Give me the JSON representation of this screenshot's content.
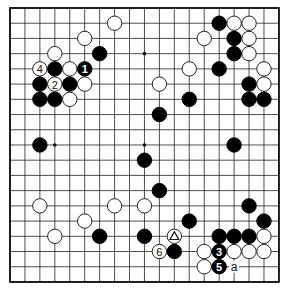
{
  "board": {
    "size": 19,
    "origin": {
      "x": 10,
      "y": 8
    },
    "spacing": {
      "x": 14.94,
      "y": 15.22
    },
    "stone_radius": 7.2,
    "colors": {
      "black": "#000000",
      "white": "#ffffff",
      "lines": "#222222",
      "background": "#ffffff"
    },
    "star_points": [
      [
        3,
        3
      ],
      [
        9,
        3
      ],
      [
        15,
        3
      ],
      [
        3,
        9
      ],
      [
        9,
        9
      ],
      [
        15,
        9
      ],
      [
        3,
        15
      ],
      [
        9,
        15
      ],
      [
        15,
        15
      ]
    ]
  },
  "stones": [
    {
      "c": 7,
      "r": 1,
      "color": "white"
    },
    {
      "c": 14,
      "r": 1,
      "color": "black"
    },
    {
      "c": 15,
      "r": 1,
      "color": "white"
    },
    {
      "c": 16,
      "r": 1,
      "color": "white"
    },
    {
      "c": 5,
      "r": 2,
      "color": "white"
    },
    {
      "c": 13,
      "r": 2,
      "color": "white"
    },
    {
      "c": 15,
      "r": 2,
      "color": "black"
    },
    {
      "c": 16,
      "r": 2,
      "color": "white"
    },
    {
      "c": 3,
      "r": 3,
      "color": "white"
    },
    {
      "c": 6,
      "r": 3,
      "color": "black"
    },
    {
      "c": 15,
      "r": 3,
      "color": "black"
    },
    {
      "c": 16,
      "r": 3,
      "color": "white"
    },
    {
      "c": 2,
      "r": 4,
      "color": "white",
      "label": "4"
    },
    {
      "c": 3,
      "r": 4,
      "color": "black"
    },
    {
      "c": 4,
      "r": 4,
      "color": "white"
    },
    {
      "c": 5,
      "r": 4,
      "color": "black",
      "label": "1"
    },
    {
      "c": 12,
      "r": 4,
      "color": "white"
    },
    {
      "c": 14,
      "r": 4,
      "color": "black"
    },
    {
      "c": 17,
      "r": 4,
      "color": "white"
    },
    {
      "c": 2,
      "r": 5,
      "color": "black"
    },
    {
      "c": 3,
      "r": 5,
      "color": "white",
      "label": "2"
    },
    {
      "c": 4,
      "r": 5,
      "color": "black"
    },
    {
      "c": 5,
      "r": 5,
      "color": "white"
    },
    {
      "c": 10,
      "r": 5,
      "color": "white"
    },
    {
      "c": 16,
      "r": 5,
      "color": "black"
    },
    {
      "c": 17,
      "r": 5,
      "color": "white"
    },
    {
      "c": 2,
      "r": 6,
      "color": "black"
    },
    {
      "c": 3,
      "r": 6,
      "color": "black"
    },
    {
      "c": 4,
      "r": 6,
      "color": "white"
    },
    {
      "c": 12,
      "r": 6,
      "color": "black"
    },
    {
      "c": 16,
      "r": 6,
      "color": "black"
    },
    {
      "c": 17,
      "r": 6,
      "color": "black"
    },
    {
      "c": 10,
      "r": 7,
      "color": "black"
    },
    {
      "c": 2,
      "r": 9,
      "color": "black"
    },
    {
      "c": 15,
      "r": 9,
      "color": "black"
    },
    {
      "c": 9,
      "r": 10,
      "color": "black"
    },
    {
      "c": 10,
      "r": 12,
      "color": "black"
    },
    {
      "c": 2,
      "r": 13,
      "color": "white"
    },
    {
      "c": 7,
      "r": 13,
      "color": "white"
    },
    {
      "c": 9,
      "r": 13,
      "color": "white"
    },
    {
      "c": 16,
      "r": 13,
      "color": "black"
    },
    {
      "c": 5,
      "r": 14,
      "color": "white"
    },
    {
      "c": 12,
      "r": 14,
      "color": "black"
    },
    {
      "c": 17,
      "r": 14,
      "color": "black"
    },
    {
      "c": 3,
      "r": 15,
      "color": "white"
    },
    {
      "c": 6,
      "r": 15,
      "color": "black"
    },
    {
      "c": 9,
      "r": 15,
      "color": "black"
    },
    {
      "c": 11,
      "r": 15,
      "color": "white",
      "mark": "triangle"
    },
    {
      "c": 14,
      "r": 15,
      "color": "black"
    },
    {
      "c": 15,
      "r": 15,
      "color": "black"
    },
    {
      "c": 16,
      "r": 15,
      "color": "black"
    },
    {
      "c": 17,
      "r": 15,
      "color": "white"
    },
    {
      "c": 10,
      "r": 16,
      "color": "white",
      "label": "6"
    },
    {
      "c": 11,
      "r": 16,
      "color": "black"
    },
    {
      "c": 13,
      "r": 16,
      "color": "white"
    },
    {
      "c": 14,
      "r": 16,
      "color": "black",
      "label": "3"
    },
    {
      "c": 15,
      "r": 16,
      "color": "white"
    },
    {
      "c": 16,
      "r": 16,
      "color": "white"
    },
    {
      "c": 17,
      "r": 16,
      "color": "white"
    },
    {
      "c": 13,
      "r": 17,
      "color": "white"
    },
    {
      "c": 14,
      "r": 17,
      "color": "black",
      "label": "5"
    }
  ],
  "point_labels": [
    {
      "c": 15,
      "r": 17,
      "text": "a"
    }
  ]
}
